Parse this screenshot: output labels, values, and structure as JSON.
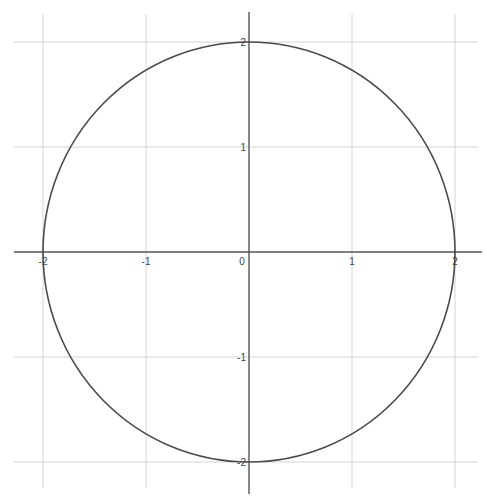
{
  "chart_data": {
    "type": "line",
    "title": "",
    "subtitle": "",
    "xlabel": "",
    "ylabel": "",
    "xlim": [
      -2.4,
      2.3
    ],
    "ylim": [
      -2.3,
      2.4
    ],
    "grid": true,
    "legend": null,
    "x_ticks": [
      -2,
      -1,
      0,
      1,
      2
    ],
    "x_tick_labels": [
      "-2",
      "-1",
      "0",
      "1",
      "2"
    ],
    "y_ticks": [
      2,
      1,
      -1,
      -2
    ],
    "y_tick_labels": [
      "2",
      "1",
      "-1",
      "-2"
    ],
    "series": [
      {
        "name": "circle",
        "equation": "x^2 + y^2 = 4",
        "center": [
          0,
          0
        ],
        "radius": 2,
        "color": "#4a4a4a",
        "key_points": [
          [
            2,
            0
          ],
          [
            0,
            2
          ],
          [
            -2,
            0
          ],
          [
            0,
            -2
          ]
        ]
      }
    ]
  },
  "colors": {
    "background": "#ffffff",
    "grid": "#d4d4d4",
    "axis": "#555555",
    "curve": "#4a4a4a",
    "labels": "#444444"
  }
}
